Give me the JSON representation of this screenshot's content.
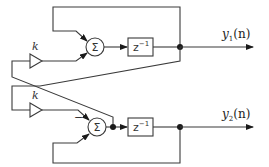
{
  "diagram": {
    "title": "",
    "sum_symbol": "Σ",
    "delay_label": "z",
    "delay_exponent": "−1",
    "gain_label": "k",
    "minus_sign": "−",
    "outputs": [
      {
        "name": "y",
        "subscript": "1",
        "arg": "(n)"
      },
      {
        "name": "y",
        "subscript": "2",
        "arg": "(n)"
      }
    ],
    "colors": {
      "line": "#3a3a3a",
      "node": "#1a1a1a",
      "background": "#ffffff"
    }
  }
}
